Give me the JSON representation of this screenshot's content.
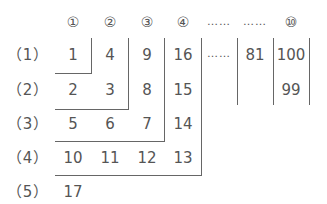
{
  "columns": [
    "①",
    "②",
    "③",
    "④",
    "……",
    "……",
    "⑩"
  ],
  "rows": [
    {
      "label": "（1）",
      "cells": [
        "1",
        "4",
        "9",
        "16",
        "……",
        "81",
        "100"
      ]
    },
    {
      "label": "（2）",
      "cells": [
        "2",
        "3",
        "8",
        "15",
        "",
        "",
        "99"
      ]
    },
    {
      "label": "（3）",
      "cells": [
        "5",
        "6",
        "7",
        "14"
      ]
    },
    {
      "label": "（4）",
      "cells": [
        "10",
        "11",
        "12",
        "13"
      ]
    },
    {
      "label": "（5）",
      "cells": [
        "17"
      ]
    }
  ]
}
